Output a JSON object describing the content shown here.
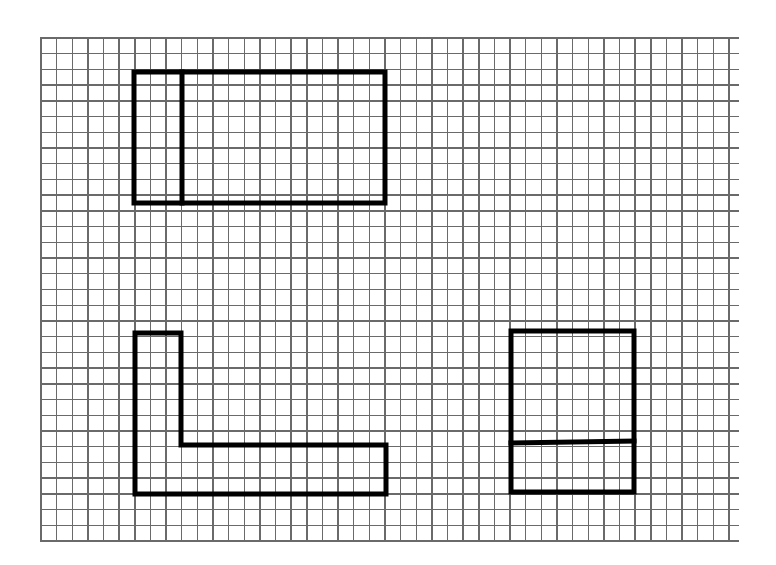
{
  "diagram": {
    "type": "orthographic-projection-sketch-on-graph-paper",
    "colors": {
      "background": "#ffffff",
      "grid": "#6a6a6a",
      "ink": "#000000"
    },
    "grid": {
      "x_start": 41,
      "x_end": 729,
      "h_line_x_end": 739,
      "y_start": 38,
      "y_end": 541,
      "columns": 44,
      "rows": 32
    },
    "views": [
      {
        "name": "top-view",
        "outer": {
          "x": 134,
          "y": 72,
          "w": 251,
          "h": 131
        },
        "dividers": [
          {
            "orientation": "vertical",
            "x1": 182,
            "y1": 72,
            "x2": 182,
            "y2": 203
          }
        ]
      },
      {
        "name": "front-view",
        "points": [
          [
            135,
            333
          ],
          [
            181,
            333
          ],
          [
            181,
            445
          ],
          [
            386,
            445
          ],
          [
            386,
            494
          ],
          [
            135,
            494
          ]
        ]
      },
      {
        "name": "side-view",
        "outer": {
          "x": 511,
          "y": 331,
          "w": 123,
          "h": 161
        },
        "dividers": [
          {
            "orientation": "horizontal",
            "x1": 511,
            "y1": 443,
            "x2": 634,
            "y2": 441
          }
        ]
      }
    ],
    "stroke_width": 5
  }
}
